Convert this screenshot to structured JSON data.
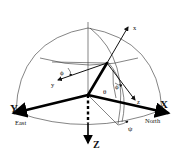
{
  "diagram": {
    "labels": {
      "X": "X",
      "Y": "Y",
      "Z": "Z",
      "north": "North",
      "east": "East",
      "x": "x",
      "y": "y",
      "z": "z",
      "phi1": "ϕ",
      "phi2": "ϕ",
      "theta": "θ",
      "psi": "ψ"
    },
    "colors": {
      "line": "#000000",
      "background": "#ffffff"
    }
  }
}
